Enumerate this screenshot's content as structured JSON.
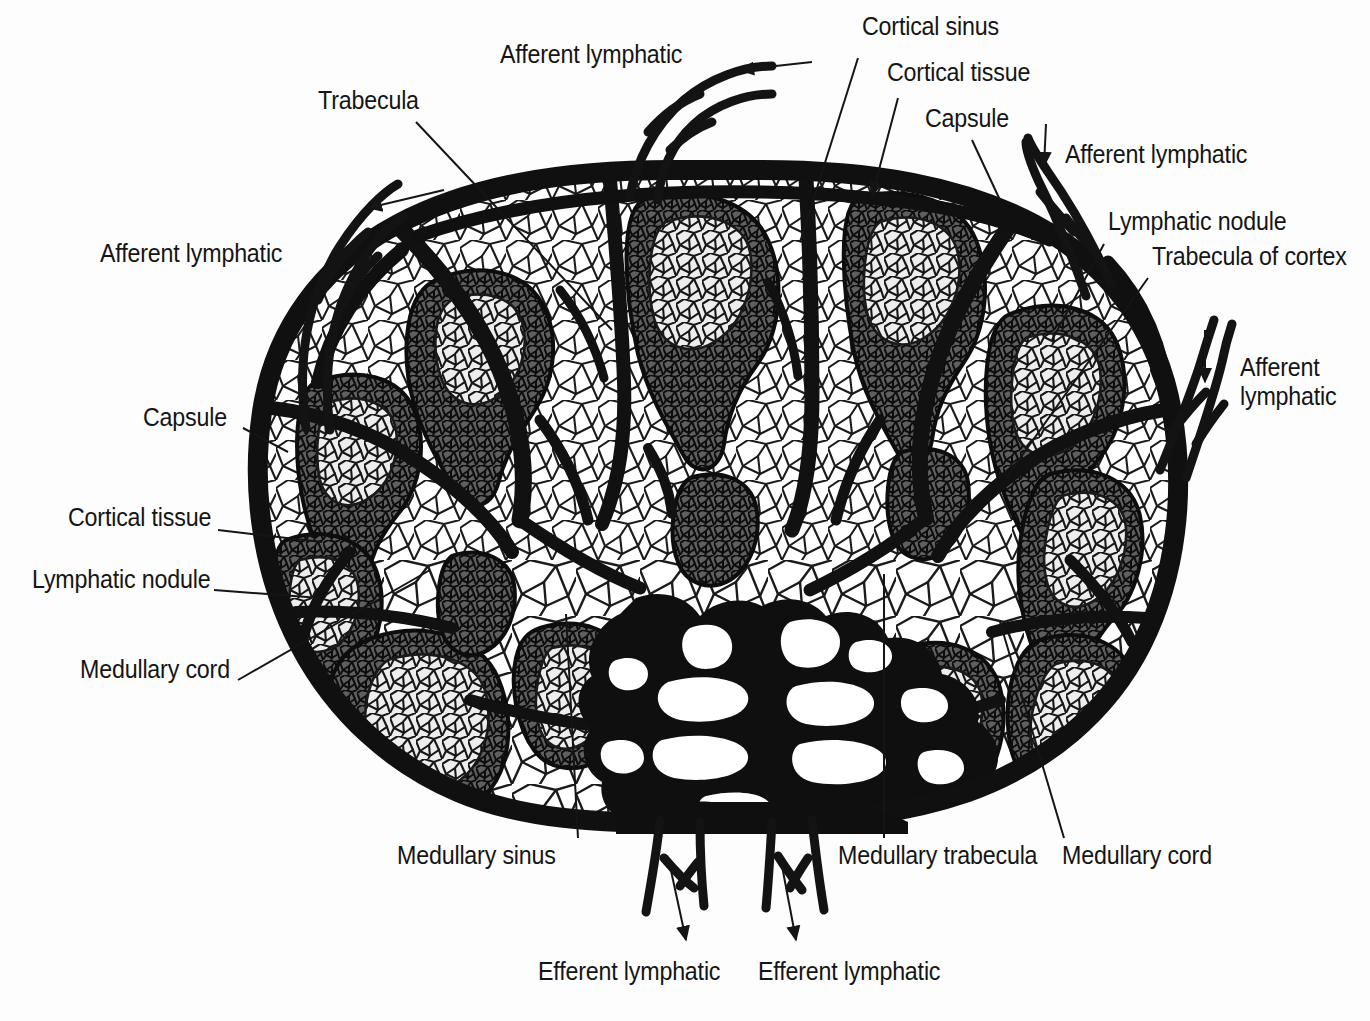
{
  "figure": {
    "type": "anatomical-diagram",
    "background_color": "#fdfdfd",
    "ink_color": "#151515",
    "nodule_fill": "#6f6f6f",
    "germinal_center_fill": "#eaeaea"
  },
  "labels": [
    {
      "id": "afferent-lymphatic-top",
      "text": "Afferent lymphatic",
      "x": 500,
      "y": 55,
      "align": "left"
    },
    {
      "id": "cortical-sinus",
      "text": "Cortical sinus",
      "x": 862,
      "y": 27,
      "align": "left"
    },
    {
      "id": "cortical-tissue-top",
      "text": "Cortical tissue",
      "x": 887,
      "y": 73,
      "align": "left"
    },
    {
      "id": "capsule-top",
      "text": "Capsule",
      "x": 925,
      "y": 117,
      "align": "left"
    },
    {
      "id": "trabecula",
      "text": "Trabecula",
      "x": 318,
      "y": 100,
      "align": "left"
    },
    {
      "id": "afferent-lymphatic-upper-right",
      "text": "Afferent lymphatic",
      "x": 1065,
      "y": 153,
      "align": "left"
    },
    {
      "id": "lymphatic-nodule-right",
      "text": "Lymphatic nodule",
      "x": 1108,
      "y": 220,
      "align": "left"
    },
    {
      "id": "trabecula-of-cortex",
      "text": "Trabecula of cortex",
      "x": 1152,
      "y": 255,
      "align": "left"
    },
    {
      "id": "afferent-lymphatic-left",
      "text": "Afferent lymphatic",
      "x": 100,
      "y": 252,
      "align": "left"
    },
    {
      "id": "afferent-lymphatic-right",
      "text": "Afferent\nlymphatic",
      "x": 1240,
      "y": 367,
      "align": "left"
    },
    {
      "id": "capsule-left",
      "text": "Capsule",
      "x": 143,
      "y": 416,
      "align": "left"
    },
    {
      "id": "cortical-tissue-left",
      "text": "Cortical tissue",
      "x": 68,
      "y": 516,
      "align": "left"
    },
    {
      "id": "lymphatic-nodule-left",
      "text": "Lymphatic nodule",
      "x": 32,
      "y": 578,
      "align": "left"
    },
    {
      "id": "medullary-cord-left",
      "text": "Medullary cord",
      "x": 80,
      "y": 668,
      "align": "left"
    },
    {
      "id": "medullary-sinus",
      "text": "Medullary sinus",
      "x": 397,
      "y": 854,
      "align": "left"
    },
    {
      "id": "medullary-trabecula",
      "text": "Medullary trabecula",
      "x": 838,
      "y": 854,
      "align": "left"
    },
    {
      "id": "medullary-cord-right",
      "text": "Medullary cord",
      "x": 1062,
      "y": 854,
      "align": "left"
    },
    {
      "id": "efferent-lymphatic-left",
      "text": "Efferent lymphatic",
      "x": 538,
      "y": 970,
      "align": "left"
    },
    {
      "id": "efferent-lymphatic-right",
      "text": "Efferent lymphatic",
      "x": 758,
      "y": 970,
      "align": "left"
    }
  ],
  "structures": {
    "capsule": "thick black outer boundary of the node",
    "nodules_count": 12,
    "afferent_vessels_count": 4,
    "efferent_vessels_count": 2,
    "hilum": "dark medullary region at lower center"
  }
}
